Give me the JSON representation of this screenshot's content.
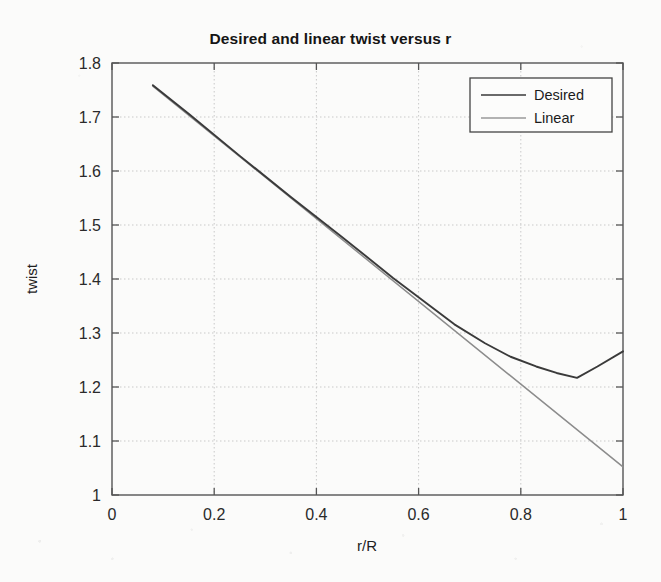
{
  "chart_data": {
    "type": "line",
    "title": "Desired and linear twist versus r",
    "xlabel": "r/R",
    "ylabel": "twist",
    "xlim": [
      0,
      1
    ],
    "ylim": [
      1,
      1.8
    ],
    "grid": true,
    "legend_position": "top-right",
    "xticks": [
      "0",
      "0.2",
      "0.4",
      "0.6",
      "0.8",
      "1"
    ],
    "xtick_values": [
      0,
      0.2,
      0.4,
      0.6,
      0.8,
      1
    ],
    "yticks": [
      "1",
      "1.1",
      "1.2",
      "1.3",
      "1.4",
      "1.5",
      "1.6",
      "1.7",
      "1.8"
    ],
    "ytick_values": [
      1,
      1.1,
      1.2,
      1.3,
      1.4,
      1.5,
      1.6,
      1.7,
      1.8
    ],
    "series": [
      {
        "name": "Desired",
        "color": "#3a3a3a",
        "x": [
          0.08,
          0.15,
          0.25,
          0.35,
          0.45,
          0.55,
          0.62,
          0.67,
          0.73,
          0.78,
          0.83,
          0.87,
          0.91,
          0.95,
          1.0
        ],
        "values": [
          1.759,
          1.706,
          1.628,
          1.552,
          1.478,
          1.402,
          1.352,
          1.316,
          1.281,
          1.256,
          1.238,
          1.226,
          1.217,
          1.238,
          1.266
        ]
      },
      {
        "name": "Linear",
        "color": "#8c8c8c",
        "x": [
          0.08,
          1.0
        ],
        "values": [
          1.757,
          1.052
        ]
      }
    ]
  },
  "legend": {
    "entries": [
      {
        "label": "Desired"
      },
      {
        "label": "Linear"
      }
    ]
  }
}
